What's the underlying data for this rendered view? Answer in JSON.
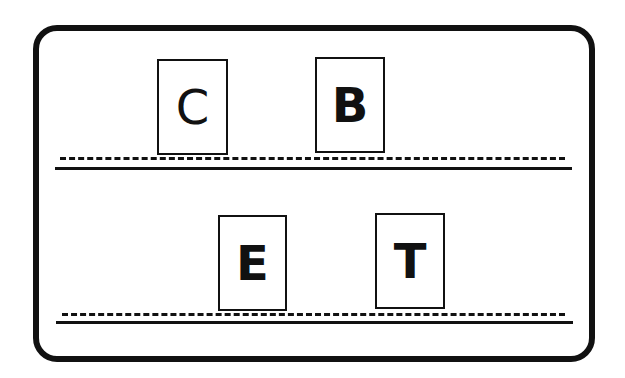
{
  "card": {
    "border_color": "#111111",
    "rows": [
      {
        "tiles": [
          {
            "letter": "C"
          },
          {
            "letter": "B"
          }
        ]
      },
      {
        "tiles": [
          {
            "letter": "E"
          },
          {
            "letter": "T"
          }
        ]
      }
    ]
  }
}
